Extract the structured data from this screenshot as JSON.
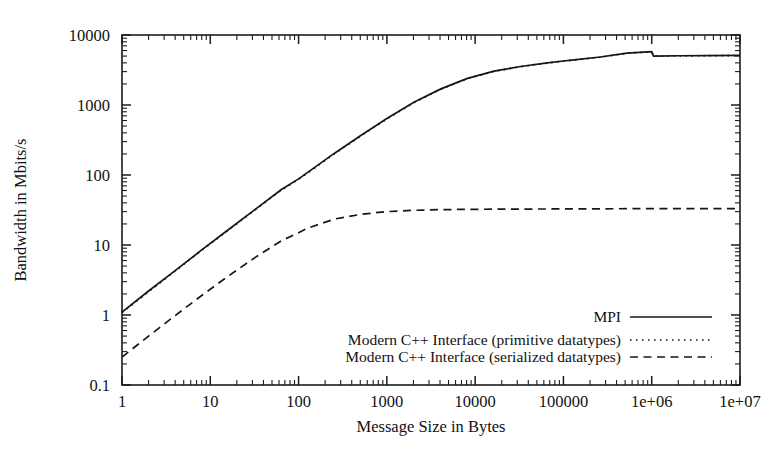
{
  "chart_data": {
    "type": "line",
    "title": "",
    "xlabel": "Message Size in Bytes",
    "ylabel": "Bandwidth in Mbits/s",
    "xscale": "log",
    "yscale": "log",
    "xlim": [
      1,
      10000000
    ],
    "ylim": [
      0.1,
      10000
    ],
    "grid": false,
    "legend_position": "lower-right-inside",
    "xtick_labels": [
      "1",
      "10",
      "100",
      "1000",
      "10000",
      "100000",
      "1e+06",
      "1e+07"
    ],
    "xtick_values": [
      1,
      10,
      100,
      1000,
      10000,
      100000,
      1000000,
      10000000
    ],
    "ytick_labels": [
      "0.1",
      "1",
      "10",
      "100",
      "1000",
      "10000"
    ],
    "ytick_values": [
      0.1,
      1,
      10,
      100,
      1000,
      10000
    ],
    "series": [
      {
        "name": "MPI",
        "style": "solid",
        "x": [
          1,
          2,
          4,
          8,
          16,
          32,
          64,
          100,
          128,
          256,
          512,
          1000,
          2048,
          4096,
          8192,
          16384,
          32768,
          65536,
          100000,
          131072,
          262144,
          524288,
          1000000,
          1048576,
          2097152,
          4194304,
          10000000
        ],
        "y": [
          1.1,
          2.2,
          4.3,
          8.5,
          16.5,
          32,
          62,
          88,
          110,
          205,
          370,
          640,
          1100,
          1700,
          2400,
          3050,
          3550,
          4000,
          4250,
          4400,
          4850,
          5500,
          5800,
          5000,
          5050,
          5080,
          5100
        ]
      },
      {
        "name": "Modern C++ Interface (primitive datatypes)",
        "style": "dotted",
        "x": [
          1,
          2,
          4,
          8,
          16,
          32,
          64,
          100,
          128,
          256,
          512,
          1000,
          2048,
          4096,
          8192,
          16384,
          32768,
          65536,
          100000,
          131072,
          262144,
          524288,
          1000000,
          1048576,
          2097152,
          4194304,
          10000000
        ],
        "y": [
          1.08,
          2.15,
          4.25,
          8.4,
          16.3,
          31.6,
          61,
          87,
          108,
          202,
          365,
          632,
          1090,
          1685,
          2380,
          3030,
          3530,
          3980,
          4230,
          4380,
          4830,
          5480,
          5780,
          4980,
          5030,
          5060,
          5080
        ]
      },
      {
        "name": "Modern C++ Interface (serialized datatypes)",
        "style": "dashed",
        "x": [
          1,
          2,
          4,
          8,
          16,
          32,
          64,
          100,
          128,
          256,
          512,
          1000,
          2048,
          4096,
          8192,
          16384,
          32768,
          65536,
          100000,
          131072,
          262144,
          524288,
          1000000,
          2097152,
          4194304,
          10000000
        ],
        "y": [
          0.25,
          0.5,
          0.98,
          1.9,
          3.6,
          6.6,
          11.5,
          15.0,
          17.5,
          23.5,
          27.5,
          30.0,
          31.3,
          32.0,
          32.3,
          32.5,
          32.6,
          32.7,
          32.8,
          32.8,
          32.9,
          33.0,
          33.0,
          33.0,
          33.1,
          33.1
        ]
      }
    ]
  },
  "legend": {
    "entries": [
      {
        "label": "MPI",
        "style": "solid"
      },
      {
        "label": "Modern C++ Interface (primitive datatypes)",
        "style": "dotted"
      },
      {
        "label": "Modern C++ Interface (serialized datatypes)",
        "style": "dashed"
      }
    ]
  },
  "colors": {
    "line": "#161616",
    "axis": "#1c1c1c",
    "background": "#ffffff",
    "text": "#111111"
  }
}
